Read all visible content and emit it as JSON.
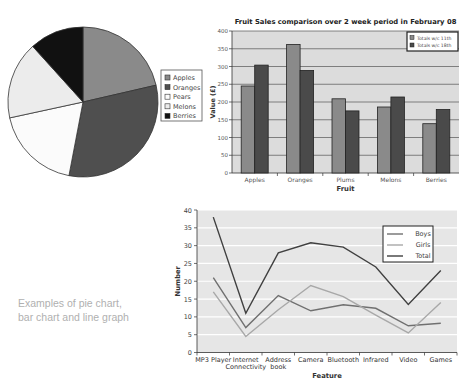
{
  "caption": {
    "line1": "Examples of pie chart,",
    "line2": "bar chart and line graph"
  },
  "chart_data": [
    {
      "type": "pie",
      "title": "",
      "categories": [
        "Apples",
        "Oranges",
        "Pears",
        "Melons",
        "Berries"
      ],
      "values": [
        21.4,
        31.6,
        18.6,
        16.7,
        11.7
      ],
      "colors": [
        "#8a8a8a",
        "#4f4f4f",
        "#fbfbfb",
        "#ececec",
        "#111111"
      ],
      "legend_position": "right"
    },
    {
      "type": "bar",
      "title": "Fruit Sales comparison over 2 week period in February 08",
      "xlabel": "Fruit",
      "ylabel": "Value (£)",
      "categories": [
        "Apples",
        "Oranges",
        "Plums",
        "Melons",
        "Berries"
      ],
      "series": [
        {
          "name": "Totals w/c 11th",
          "values": [
            245,
            362,
            209,
            186,
            139
          ],
          "color": "#8a8a8a"
        },
        {
          "name": "Totals w/c 18th",
          "values": [
            304,
            289,
            175,
            214,
            179
          ],
          "color": "#4a4a4a"
        }
      ],
      "ylim": [
        0,
        400
      ],
      "yticks": [
        0,
        50,
        100,
        150,
        200,
        250,
        300,
        350,
        400
      ],
      "grid": true,
      "legend_position": "top-right"
    },
    {
      "type": "line",
      "title": "",
      "xlabel": "Feature",
      "ylabel": "Number",
      "categories": [
        "MP3 Player",
        "Internet Connectivity",
        "Address book",
        "Camera",
        "Bluetooth",
        "Infrared",
        "Video",
        "Games"
      ],
      "category_lines": [
        [
          "MP3 Player"
        ],
        [
          "Internet",
          "Connectivity"
        ],
        [
          "Address",
          "book"
        ],
        [
          "Camera"
        ],
        [
          "Bluetooth"
        ],
        [
          "Infrared"
        ],
        [
          "Video"
        ],
        [
          "Games"
        ]
      ],
      "series": [
        {
          "name": "Boys",
          "values": [
            21,
            7,
            16,
            11.7,
            13.4,
            12.4,
            7.5,
            8.2
          ],
          "color": "#707070"
        },
        {
          "name": "Girls",
          "values": [
            17,
            4.5,
            12,
            18.8,
            15.7,
            10.5,
            5.5,
            14
          ],
          "color": "#a8a8a8"
        },
        {
          "name": "Total",
          "values": [
            38,
            11,
            28,
            30.8,
            29.6,
            24,
            13.5,
            23
          ],
          "color": "#404040"
        }
      ],
      "ylim": [
        0,
        40
      ],
      "yticks": [
        0,
        5,
        10,
        15,
        20,
        25,
        30,
        35,
        40
      ],
      "grid": true,
      "legend_position": "top-right"
    }
  ]
}
